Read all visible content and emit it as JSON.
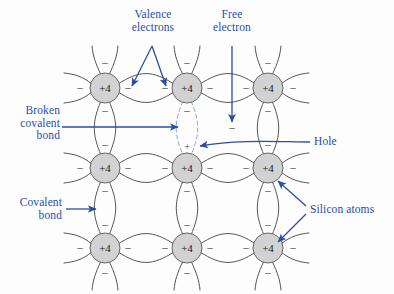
{
  "figure": {
    "background_color": "#fdfdfe",
    "annotation_color": "#2b4ea2",
    "lattice_line_color": "#555555",
    "atom_fill_color": "#d2d2d2",
    "atom_stroke_color": "#666666",
    "atom_text_color": "#1a1a1a"
  },
  "labels": {
    "valence_electrons": "Valence\nelectrons",
    "free_electron": "Free\nelectron",
    "broken_covalent_bond": "Broken\ncovalent\nbond",
    "covalent_bond": "Covalent\nbond",
    "hole": "Hole",
    "silicon_atoms": "Silicon atoms"
  },
  "atoms": {
    "core_label": "+4",
    "columns_x": [
      105,
      187,
      268
    ],
    "rows_y": [
      88,
      168,
      248
    ],
    "radius": 15,
    "count": 9
  },
  "charges": {
    "electron_symbol": "–",
    "hole_symbol": "+"
  },
  "markers": {
    "hole_position": {
      "x": 187,
      "y": 146
    },
    "free_electron_position": {
      "x": 232,
      "y": 128
    },
    "broken_bond_between": "column 2, row 1 and row 2"
  }
}
